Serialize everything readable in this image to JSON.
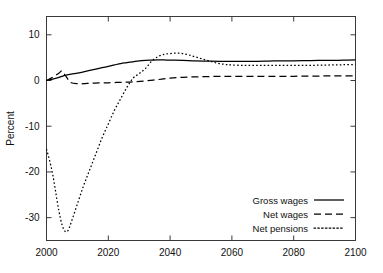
{
  "chart_data": {
    "type": "line",
    "title": "",
    "xlabel": "",
    "ylabel": "Percent",
    "xlim": [
      2000,
      2100
    ],
    "ylim": [
      -35,
      14
    ],
    "xticks": [
      2000,
      2020,
      2040,
      2060,
      2080,
      2100
    ],
    "xtick_labels": [
      "2000",
      "2020",
      "2040",
      "2060",
      "2080",
      "2100"
    ],
    "yticks": [
      10,
      0,
      -10,
      -20,
      -30
    ],
    "ytick_labels": [
      "10",
      "0",
      "-10",
      "-20",
      "-30"
    ],
    "grid": false,
    "legend_position": "lower right",
    "series": [
      {
        "name": "Gross wages",
        "style": "solid",
        "x": [
          2000,
          2002,
          2004,
          2005,
          2006,
          2008,
          2010,
          2012,
          2014,
          2016,
          2018,
          2020,
          2022,
          2024,
          2026,
          2028,
          2030,
          2032,
          2034,
          2036,
          2038,
          2040,
          2044,
          2048,
          2052,
          2056,
          2060,
          2064,
          2068,
          2072,
          2076,
          2080,
          2084,
          2088,
          2092,
          2096,
          2100
        ],
        "values": [
          0.0,
          0.3,
          0.7,
          0.9,
          1.1,
          1.4,
          1.6,
          1.9,
          2.2,
          2.5,
          2.8,
          3.1,
          3.4,
          3.7,
          3.9,
          4.1,
          4.3,
          4.4,
          4.45,
          4.5,
          4.5,
          4.45,
          4.4,
          4.3,
          4.25,
          4.2,
          4.2,
          4.2,
          4.2,
          4.25,
          4.3,
          4.3,
          4.35,
          4.4,
          4.4,
          4.45,
          4.5
        ]
      },
      {
        "name": "Net wages",
        "style": "dashed",
        "x": [
          2000,
          2002,
          2004,
          2005,
          2006,
          2007,
          2008,
          2010,
          2012,
          2014,
          2016,
          2018,
          2020,
          2024,
          2028,
          2032,
          2036,
          2040,
          2044,
          2048,
          2052,
          2056,
          2060,
          2068,
          2076,
          2084,
          2092,
          2100
        ],
        "values": [
          0.0,
          0.7,
          1.6,
          2.1,
          1.2,
          0.2,
          -0.5,
          -0.7,
          -0.7,
          -0.6,
          -0.55,
          -0.5,
          -0.5,
          -0.4,
          -0.3,
          -0.1,
          0.2,
          0.5,
          0.7,
          0.8,
          0.85,
          0.9,
          0.9,
          0.9,
          0.9,
          0.95,
          1.0,
          1.0
        ]
      },
      {
        "name": "Net pensions",
        "style": "dotted",
        "x": [
          2000,
          2001,
          2002,
          2003,
          2004,
          2005,
          2006,
          2007,
          2008,
          2010,
          2012,
          2014,
          2016,
          2018,
          2020,
          2022,
          2024,
          2026,
          2028,
          2030,
          2032,
          2034,
          2036,
          2038,
          2040,
          2042,
          2044,
          2046,
          2048,
          2050,
          2052,
          2054,
          2056,
          2058,
          2060,
          2064,
          2068,
          2072,
          2076,
          2080,
          2084,
          2088,
          2092,
          2096,
          2100
        ],
        "values": [
          -15.0,
          -17.5,
          -20.5,
          -24.5,
          -28.5,
          -31.5,
          -33.0,
          -32.8,
          -31.0,
          -27.0,
          -23.0,
          -19.5,
          -16.0,
          -12.5,
          -9.5,
          -6.5,
          -4.0,
          -1.5,
          0.5,
          1.5,
          2.6,
          4.2,
          5.2,
          5.7,
          5.9,
          6.0,
          5.9,
          5.6,
          5.2,
          4.8,
          4.4,
          4.0,
          3.7,
          3.5,
          3.4,
          3.3,
          3.3,
          3.3,
          3.3,
          3.3,
          3.3,
          3.35,
          3.4,
          3.45,
          3.5
        ]
      }
    ],
    "legend": [
      {
        "label": "Gross wages",
        "style": "solid"
      },
      {
        "label": "Net wages",
        "style": "dashed"
      },
      {
        "label": "Net pensions",
        "style": "dotted"
      }
    ]
  }
}
